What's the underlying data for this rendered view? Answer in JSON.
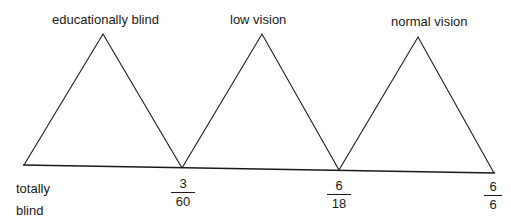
{
  "categories": [
    {
      "label": "educationally blind"
    },
    {
      "label": "low vision"
    },
    {
      "label": "normal vision"
    }
  ],
  "axis": {
    "start_label_line1": "totally",
    "start_label_line2": "blind",
    "ticks": [
      {
        "numerator": "3",
        "denominator": "60"
      },
      {
        "numerator": "6",
        "denominator": "18"
      },
      {
        "numerator": "6",
        "denominator": "6"
      }
    ]
  },
  "colors": {
    "line": "#1a1a1a",
    "background": "#ffffff"
  }
}
